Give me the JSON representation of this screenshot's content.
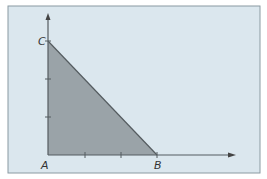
{
  "diagram": {
    "type": "right-triangle-on-axes",
    "colors": {
      "background": "#dbe7ee",
      "border": "#8a9aa2",
      "fill": "#9aa3a8",
      "line": "#555c60"
    },
    "points": {
      "A": {
        "label": "A"
      },
      "B": {
        "label": "B"
      },
      "C": {
        "label": "C"
      }
    },
    "x_ticks": 2,
    "y_ticks": 2
  }
}
